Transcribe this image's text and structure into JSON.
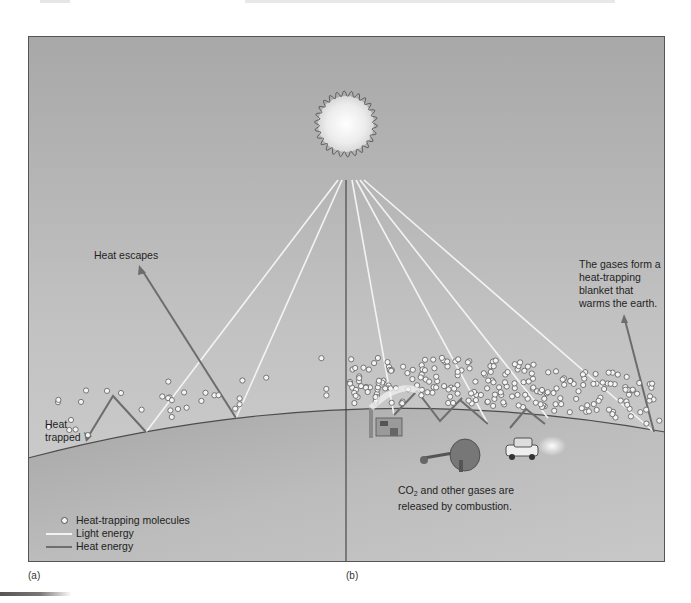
{
  "figure": {
    "panel_a_label": "(a)",
    "panel_b_label": "(b)",
    "colors": {
      "sky_top": "#a9a9a9",
      "sky_bottom": "#c9c9c9",
      "earth": "#b4b4b4",
      "light_ray": "#f3f3f3",
      "heat_arrow": "#6d6d6d",
      "molecule_fill": "#f4f4f4",
      "molecule_stroke": "#5a5a5a",
      "frame": "#555555"
    }
  },
  "panel_a": {
    "heat_escapes": "Heat escapes",
    "heat_trapped_line1": "Heat",
    "heat_trapped_line2": "trapped"
  },
  "panel_b": {
    "blanket_line1": "The gases form a",
    "blanket_line2": "heat-trapping",
    "blanket_line3": "blanket that",
    "blanket_line4": "warms the earth.",
    "combustion_co": "CO",
    "combustion_sub": "2",
    "combustion_line1_rest": " and other gases are",
    "combustion_line2": "released by combustion."
  },
  "legend": {
    "items": [
      {
        "icon": "molecule-circle-icon",
        "label": "Heat-trapping molecules"
      },
      {
        "icon": "light-line-icon",
        "label": "Light energy"
      },
      {
        "icon": "heat-line-icon",
        "label": "Heat energy"
      }
    ]
  }
}
